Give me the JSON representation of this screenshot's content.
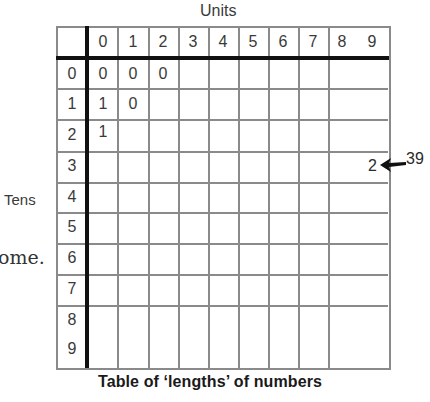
{
  "axis_labels": {
    "columns_title": "Units",
    "rows_title": "Tens"
  },
  "caption": "Table of ‘lengths’ of numbers",
  "clipped_body_text": "ome.",
  "column_headers": [
    "0",
    "1",
    "2",
    "3",
    "4",
    "5",
    "6",
    "7",
    "8",
    "9"
  ],
  "row_headers": [
    "0",
    "1",
    "2",
    "3",
    "4",
    "5",
    "6",
    "7",
    "8",
    "9"
  ],
  "cells": [
    {
      "row": "0",
      "col": "0",
      "value": "0"
    },
    {
      "row": "0",
      "col": "1",
      "value": "0"
    },
    {
      "row": "0",
      "col": "2",
      "value": "0"
    },
    {
      "row": "1",
      "col": "0",
      "value": "1"
    },
    {
      "row": "1",
      "col": "1",
      "value": "0"
    },
    {
      "row": "2",
      "col": "0",
      "value": "1"
    },
    {
      "row": "3",
      "col": "9",
      "value": "2"
    }
  ],
  "annotation": {
    "value": "39",
    "arrow_icon": "left-arrow-icon",
    "target_cell_value": "2"
  }
}
